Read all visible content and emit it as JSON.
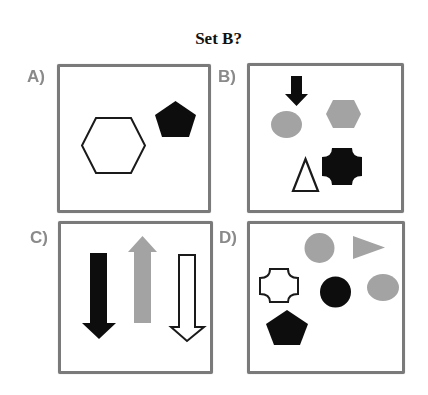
{
  "title": "Set B?",
  "colors": {
    "black": "#0d0d0d",
    "gray": "#a3a3a3",
    "white": "#ffffff",
    "outline": "#1a1a1a",
    "panel_border": "#7a7a7a",
    "label": "#8a8a8a"
  },
  "options": [
    {
      "label": "A)",
      "shapes": [
        "white hexagon (outlined)",
        "black pentagon"
      ]
    },
    {
      "label": "B)",
      "shapes": [
        "black down arrow",
        "gray ellipse",
        "gray hexagon",
        "white triangle (outlined)",
        "black rounded cross"
      ]
    },
    {
      "label": "C)",
      "shapes": [
        "black down arrow",
        "gray up arrow",
        "white down arrow (outlined)"
      ]
    },
    {
      "label": "D)",
      "shapes": [
        "gray circle",
        "gray right-pointing triangle",
        "white rounded cross (outlined)",
        "black circle",
        "gray ellipse",
        "black pentagon"
      ]
    }
  ]
}
